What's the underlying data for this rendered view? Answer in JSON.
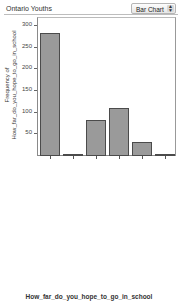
{
  "header": {
    "title": "Ontario Youths",
    "chart_type_select": "Bar Chart"
  },
  "chart_data": {
    "type": "bar",
    "title": "",
    "xlabel": "How_far_do_you_hope_to_go_in_school",
    "ylabel_line1": "Frequency of",
    "ylabel_line2": "How_far_do_you_hope_to_go_in_school",
    "ylim": [
      0,
      320
    ],
    "yticks": [
      50,
      100,
      150,
      200,
      250,
      300
    ],
    "grid": false,
    "categories": [
      "I WILL COMPLETE A UNIVERSITY DEGREE",
      "I WILL COMPLETE MIDDLE SCHOOL/JUNIOR HIGH",
      "I DON-T KNOW",
      "I WILL COMPLETE COLLEGE",
      "I WILL COMPLETE HIGH SCHOOL",
      "OTHER"
    ],
    "values": [
      285,
      3,
      84,
      111,
      32,
      4
    ],
    "bar_color": "#9a9a9a",
    "bar_edge_color": "#4b4b4b"
  }
}
